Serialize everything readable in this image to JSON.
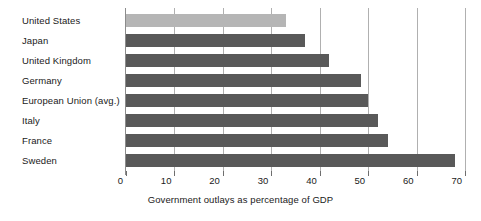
{
  "chart_data": {
    "type": "bar",
    "orientation": "horizontal",
    "title": "",
    "xlabel": "Government outlays as percentage of GDP",
    "ylabel": "",
    "categories": [
      "United States",
      "Japan",
      "United Kingdom",
      "Germany",
      "European Union (avg.)",
      "Italy",
      "France",
      "Sweden"
    ],
    "values": [
      33,
      37,
      42,
      48.5,
      50,
      52,
      54,
      68
    ],
    "xlim": [
      0,
      70
    ],
    "xticks": [
      0,
      10,
      20,
      30,
      40,
      50,
      60,
      70
    ],
    "xtick_labels": [
      "0",
      "10",
      "20",
      "30",
      "40",
      "50",
      "60",
      "70"
    ],
    "grid": "vertical",
    "legend": "none",
    "bar_color": "#595959",
    "highlight_color": "#b5b5b5",
    "highlight_category": "United States",
    "gridline_color": "#b0b0b0",
    "axis_color": "#8c8c8c"
  }
}
